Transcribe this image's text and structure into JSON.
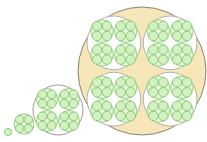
{
  "diagram": {
    "title": "Recursive circle packing (4-fold nesting by level)",
    "colors": {
      "background": "#ffffff",
      "outer_fill": "#f7e7b8",
      "outer_stroke": "#8c8070",
      "level2_fill": "#ffffff",
      "level2_stroke": "#9aa39a",
      "level1_fill": "#e8f6dc",
      "level1_stroke": "#86c870",
      "level0_fill": "#d2f0c2",
      "level0_stroke": "#6cbf55"
    },
    "figures": [
      {
        "level": 0,
        "cx": 8,
        "cy": 132,
        "r": 3.6
      },
      {
        "level": 1,
        "cx": 24,
        "cy": 124,
        "r": 10
      },
      {
        "level": 2,
        "cx": 58,
        "cy": 110,
        "r": 25
      },
      {
        "level": 3,
        "cx": 142,
        "cy": 71,
        "r": 64
      }
    ],
    "child_ratio": 0.5,
    "child_offset_ratio": 0.5
  }
}
